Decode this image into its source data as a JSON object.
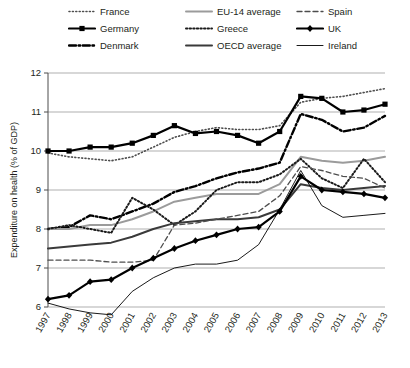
{
  "chart_data": {
    "type": "line",
    "title": "",
    "xlabel": "",
    "ylabel": "Expenditure on health (% of GDP)",
    "grid": true,
    "legend_position": "top",
    "ylim": [
      6,
      12
    ],
    "yticks": [
      6,
      7,
      8,
      9,
      10,
      11,
      12
    ],
    "ytick_labels": [
      "6",
      "7",
      "8",
      "9",
      "10",
      "11",
      "12"
    ],
    "x": [
      1997,
      1998,
      1999,
      2000,
      2001,
      2002,
      2003,
      2004,
      2005,
      2006,
      2007,
      2008,
      2009,
      2010,
      2011,
      2012,
      2013
    ],
    "xtick_labels": [
      "1997",
      "1998",
      "1999",
      "2000",
      "2001",
      "2002",
      "2003",
      "2004",
      "2005",
      "2006",
      "2007",
      "2008",
      "2009",
      "2010",
      "2011",
      "2012",
      "2013"
    ],
    "series": [
      {
        "name": "France",
        "style": "dotted",
        "color": "#4d4d4d",
        "width": 1.6,
        "dash": "1,2.4",
        "marker": "none",
        "values": [
          9.95,
          9.85,
          9.8,
          9.75,
          9.85,
          10.1,
          10.35,
          10.5,
          10.6,
          10.55,
          10.55,
          10.65,
          11.25,
          11.35,
          11.4,
          11.5,
          11.6
        ]
      },
      {
        "name": "Germany",
        "style": "solid-marker",
        "color": "#000000",
        "width": 2.2,
        "dash": "",
        "marker": "square",
        "values": [
          10.0,
          10.0,
          10.1,
          10.1,
          10.2,
          10.4,
          10.65,
          10.45,
          10.5,
          10.4,
          10.2,
          10.5,
          11.4,
          11.35,
          11.0,
          11.05,
          11.2
        ]
      },
      {
        "name": "Denmark",
        "style": "dash-dot",
        "color": "#000000",
        "width": 2.4,
        "dash": "7,2.6,1.6,2.6",
        "marker": "none",
        "values": [
          8.0,
          8.05,
          8.35,
          8.25,
          8.45,
          8.65,
          8.95,
          9.1,
          9.3,
          9.45,
          9.55,
          9.7,
          10.95,
          10.8,
          10.5,
          10.6,
          10.9
        ]
      },
      {
        "name": "EU-14 average",
        "style": "solid",
        "color": "#9b9b9b",
        "width": 2.0,
        "dash": "",
        "marker": "none",
        "values": [
          8.0,
          8.0,
          8.1,
          8.1,
          8.25,
          8.45,
          8.7,
          8.8,
          8.9,
          8.9,
          8.9,
          9.15,
          9.85,
          9.75,
          9.7,
          9.75,
          9.85
        ]
      },
      {
        "name": "Greece",
        "style": "dotted-bold",
        "color": "#1a1a1a",
        "width": 2.0,
        "dash": "1.4,2.2",
        "marker": "none",
        "values": [
          8.0,
          8.1,
          8.0,
          7.9,
          8.8,
          8.5,
          8.1,
          8.45,
          9.0,
          9.2,
          9.2,
          9.4,
          9.8,
          9.3,
          9.05,
          9.8,
          9.2
        ]
      },
      {
        "name": "OECD average",
        "style": "solid",
        "color": "#3a3a3a",
        "width": 2.0,
        "dash": "",
        "marker": "none",
        "values": [
          7.5,
          7.55,
          7.6,
          7.65,
          7.8,
          8.0,
          8.15,
          8.2,
          8.25,
          8.25,
          8.3,
          8.5,
          9.15,
          9.05,
          9.0,
          9.05,
          9.1
        ]
      },
      {
        "name": "Spain",
        "style": "dashed",
        "color": "#4d4d4d",
        "width": 1.3,
        "dash": "5,3",
        "marker": "none",
        "values": [
          7.2,
          7.2,
          7.2,
          7.15,
          7.15,
          7.2,
          8.1,
          8.15,
          8.25,
          8.35,
          8.45,
          8.85,
          9.6,
          9.5,
          9.35,
          9.3,
          9.05
        ]
      },
      {
        "name": "UK",
        "style": "solid-marker",
        "color": "#000000",
        "width": 2.2,
        "dash": "",
        "marker": "diamond",
        "values": [
          6.2,
          6.3,
          6.65,
          6.7,
          7.0,
          7.25,
          7.5,
          7.7,
          7.85,
          8.0,
          8.05,
          8.45,
          9.35,
          9.0,
          8.95,
          8.9,
          8.8
        ]
      },
      {
        "name": "Ireland",
        "style": "thin-solid",
        "color": "#000000",
        "width": 0.9,
        "dash": "",
        "marker": "none",
        "values": [
          6.1,
          5.95,
          5.85,
          5.8,
          6.4,
          6.75,
          7.0,
          7.1,
          7.1,
          7.2,
          7.6,
          8.5,
          9.5,
          8.6,
          8.3,
          8.35,
          8.4
        ]
      }
    ]
  },
  "legend": {
    "items": [
      {
        "label": "France"
      },
      {
        "label": "EU-14 average"
      },
      {
        "label": "Spain"
      },
      {
        "label": "Germany"
      },
      {
        "label": "Greece"
      },
      {
        "label": "UK"
      },
      {
        "label": "Denmark"
      },
      {
        "label": "OECD average"
      },
      {
        "label": "Ireland"
      }
    ]
  }
}
